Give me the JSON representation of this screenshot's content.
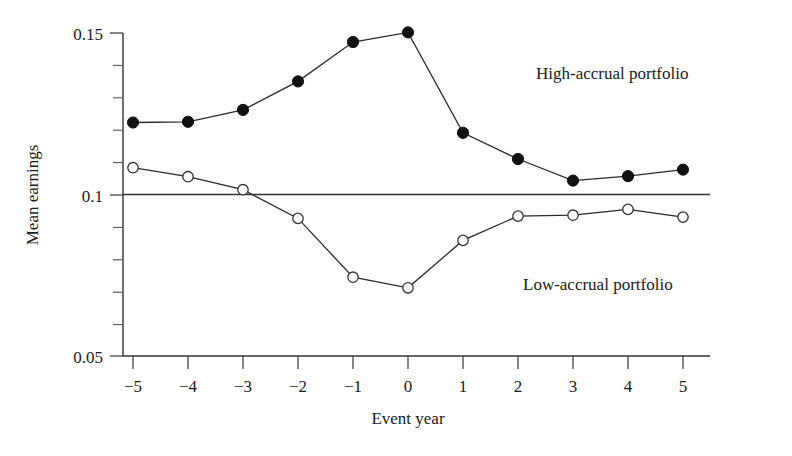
{
  "chart_data": {
    "type": "line",
    "title": "",
    "xlabel": "Event year",
    "ylabel": "Mean earnings",
    "x": [
      -5,
      -4,
      -3,
      -2,
      -1,
      0,
      1,
      2,
      3,
      4,
      5
    ],
    "xtick_labels": [
      "−5",
      "−4",
      "−3",
      "−2",
      "−1",
      "0",
      "1",
      "2",
      "3",
      "4",
      "5"
    ],
    "xlim": [
      -5,
      5
    ],
    "ylim": [
      0.05,
      0.15
    ],
    "ytick_labels": [
      "0.15",
      "0.1",
      "0.05"
    ],
    "ytick_values": [
      0.15,
      0.1,
      0.05
    ],
    "yminor_step": 0.01,
    "grid": false,
    "reference_line": 0.1,
    "legend_position": "inline-annotation",
    "series": [
      {
        "name": "High-accrual portfolio",
        "marker": "filled-circle",
        "values": [
          0.1223,
          0.1225,
          0.1262,
          0.135,
          0.1472,
          0.1502,
          0.1191,
          0.111,
          0.1043,
          0.1057,
          0.1077
        ]
      },
      {
        "name": "Low-accrual portfolio",
        "marker": "open-circle",
        "values": [
          0.1083,
          0.1055,
          0.1015,
          0.0926,
          0.0744,
          0.0711,
          0.0858,
          0.0933,
          0.0936,
          0.0954,
          0.093
        ]
      }
    ],
    "annotations": [
      {
        "text": "High-accrual portfolio",
        "x_px": 536,
        "y_px": 79
      },
      {
        "text": "Low-accrual portfolio",
        "x_px": 523,
        "y_px": 290
      }
    ]
  }
}
